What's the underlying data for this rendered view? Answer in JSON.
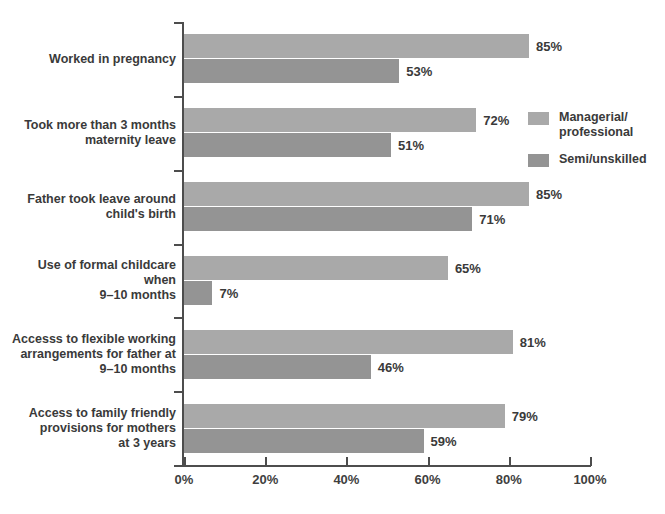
{
  "chart_data": {
    "type": "bar",
    "orientation": "horizontal",
    "title": "",
    "subtitle": "",
    "xlabel": "",
    "ylabel": "",
    "xlim": [
      0,
      100
    ],
    "xtick_labels": [
      "0%",
      "20%",
      "40%",
      "60%",
      "80%",
      "100%"
    ],
    "xtick_values": [
      0,
      20,
      40,
      60,
      80,
      100
    ],
    "grid": false,
    "legend_position": "right-upper",
    "value_label_suffix": "%",
    "categories": [
      "Worked in pregnancy",
      "Took more than 3 months\nmaternity leave",
      "Father took leave around\nchild's birth",
      "Use of formal childcare when\n9–10 months",
      "Accesss to flexible working\narrangements for father at\n9–10 months",
      "Access to family friendly\nprovisions for mothers\nat 3 years"
    ],
    "series": [
      {
        "name": "Managerial/\nprofessional",
        "color": "#a9a9a9",
        "values": [
          85,
          72,
          85,
          65,
          81,
          79
        ],
        "value_labels": [
          "85%",
          "72%",
          "85%",
          "65%",
          "81%",
          "79%"
        ]
      },
      {
        "name": "Semi/unskilled",
        "color": "#949494",
        "values": [
          53,
          51,
          71,
          7,
          46,
          59
        ],
        "value_labels": [
          "53%",
          "51%",
          "71%",
          "7%",
          "46%",
          "59%"
        ]
      }
    ]
  },
  "colors": {
    "axis": "#4d4d4d",
    "text": "#3a3a3a",
    "background": "#ffffff",
    "series_1": "#a9a9a9",
    "series_2": "#949494"
  }
}
